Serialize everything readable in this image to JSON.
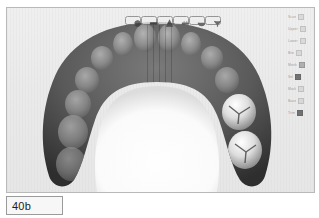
{
  "figure": {
    "label": "40b"
  },
  "app": {
    "viewport_title": "3D dental arch scan viewport",
    "toolbar": {
      "buttons": [
        {
          "name": "rotate-icon",
          "label": "Rotate"
        },
        {
          "name": "pan-icon",
          "label": "Pan"
        },
        {
          "name": "measure-icon",
          "label": "Measure"
        },
        {
          "name": "ruler-icon",
          "label": "Ruler"
        },
        {
          "name": "occlusion-icon",
          "label": "Occlusion"
        },
        {
          "name": "trim-icon",
          "label": "Trim"
        }
      ]
    },
    "side_panel": {
      "rows": [
        {
          "label": "Scan",
          "swatch": "light"
        },
        {
          "label": "Upper",
          "swatch": "light"
        },
        {
          "label": "Lower",
          "swatch": "light"
        },
        {
          "label": "Bite",
          "swatch": "light"
        },
        {
          "label": "Mesh",
          "swatch": "mid"
        },
        {
          "label": "Sel",
          "swatch": "dark"
        },
        {
          "label": "Mark",
          "swatch": "light"
        },
        {
          "label": "Base",
          "swatch": "light"
        },
        {
          "label": "Trim",
          "swatch": "dark"
        }
      ]
    },
    "model": {
      "description": "Upper dental arch, occlusal view",
      "arch_shade": "#5d5d5d",
      "highlight_shade": "#e8e8e8",
      "palate_shade": "#fdfdfd",
      "highlighted_teeth": [
        "molar-1",
        "molar-2"
      ]
    }
  }
}
